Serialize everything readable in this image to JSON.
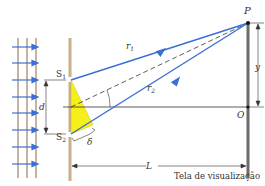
{
  "diagram": {
    "labels": {
      "point_p": "P",
      "origin_o": "O",
      "slit1": "S",
      "slit1_sub": "1",
      "slit2": "S",
      "slit2_sub": "2",
      "ray1": "r",
      "ray1_sub": "1",
      "ray2": "r",
      "ray2_sub": "2",
      "slit_separation": "d",
      "screen_height": "y",
      "path_difference": "δ",
      "screen_distance": "L",
      "screen_caption": "Tela de visualização"
    },
    "colors": {
      "ray": "#3b6fd4",
      "barrier": "#c8b08a",
      "screen": "#6b6b6b",
      "triangle": "#f7ef1a",
      "wavefront": "#a08060",
      "dimension": "#333333"
    }
  }
}
